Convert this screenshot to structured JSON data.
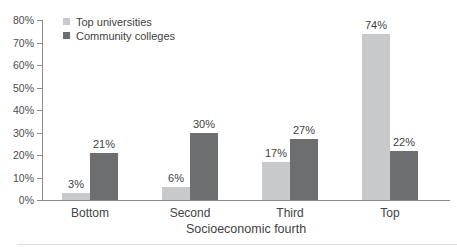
{
  "chart_data": {
    "type": "bar",
    "categories": [
      "Bottom",
      "Second",
      "Third",
      "Top"
    ],
    "series": [
      {
        "name": "Top universities",
        "color": "#c8c9ca",
        "values": [
          3,
          6,
          17,
          74
        ]
      },
      {
        "name": "Community colleges",
        "color": "#6d6e70",
        "values": [
          21,
          30,
          27,
          22
        ]
      }
    ],
    "value_labels": [
      [
        "3%",
        "6%",
        "17%",
        "74%"
      ],
      [
        "21%",
        "30%",
        "27%",
        "22%"
      ]
    ],
    "title": "",
    "xlabel": "Socioeconomic fourth",
    "ylabel": "",
    "ylim": [
      0,
      80
    ],
    "ytick_step": 10,
    "ytick_suffix": "%",
    "grid": false,
    "legend_position": "top-left",
    "axis_color": "#8a8c8e",
    "text_color": "#414244"
  }
}
